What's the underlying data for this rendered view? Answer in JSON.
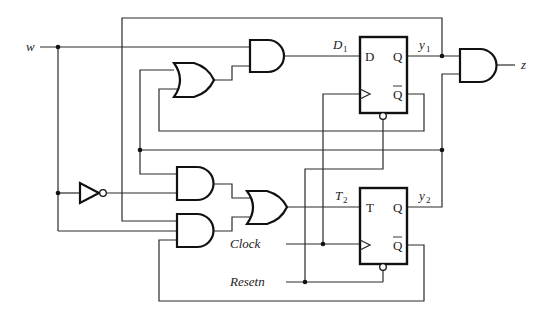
{
  "diagram": {
    "type": "sequential-logic-circuit",
    "inputs": {
      "w": "w",
      "clock": "Clock",
      "resetn": "Resetn"
    },
    "output": {
      "z": "z"
    },
    "flipflops": [
      {
        "id": "ff1",
        "type": "D",
        "input_label": "D",
        "q_label": "Q",
        "qbar_label": "Q",
        "signal_in": "D",
        "signal_in_sub": "1",
        "signal_out": "y",
        "signal_out_sub": "1"
      },
      {
        "id": "ff2",
        "type": "T",
        "input_label": "T",
        "q_label": "Q",
        "qbar_label": "Q",
        "signal_in": "T",
        "signal_in_sub": "2",
        "signal_out": "y",
        "signal_out_sub": "2"
      }
    ],
    "gates": [
      {
        "id": "and-d1",
        "type": "AND"
      },
      {
        "id": "or-d1",
        "type": "OR"
      },
      {
        "id": "not-w",
        "type": "NOT"
      },
      {
        "id": "and-t2-top",
        "type": "AND"
      },
      {
        "id": "and-t2-bottom",
        "type": "AND"
      },
      {
        "id": "or-t2",
        "type": "OR"
      },
      {
        "id": "and-z",
        "type": "AND"
      }
    ]
  }
}
